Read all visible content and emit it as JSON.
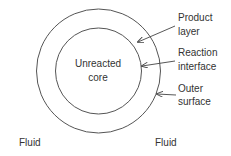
{
  "diagram": {
    "core_label": [
      "Unreacted",
      "core"
    ],
    "callouts": [
      {
        "id": "product-layer",
        "lines": [
          "Product",
          "layer"
        ]
      },
      {
        "id": "reaction-interface",
        "lines": [
          "Reaction",
          "interface"
        ]
      },
      {
        "id": "outer-surface",
        "lines": [
          "Outer",
          "surface"
        ]
      }
    ],
    "fluid_labels": [
      "Fluid",
      "Fluid"
    ],
    "colors": {
      "stroke": "#555555",
      "text": "#333333",
      "background": "#ffffff"
    }
  }
}
